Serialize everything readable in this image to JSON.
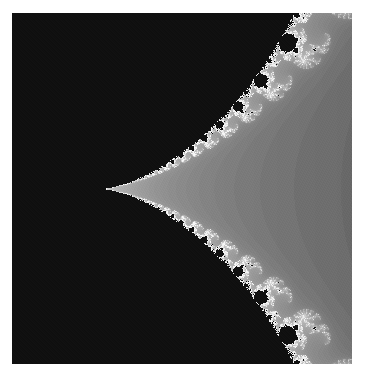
{
  "image": {
    "subject": "Mandelbrot set cusp (seahorse-valley style boundary detail)",
    "alt": "Grayscale fractal: black Mandelbrot set region on left with cusp pointing right, white and gray escape-time gradient on right",
    "colors": {
      "set": "#0d0d0d",
      "boundary": "#ffffff",
      "far_field": "#4a4a4a",
      "background": "#ffffff"
    },
    "view": {
      "center_re": 0.295,
      "center_im": 0.0,
      "width": 0.17,
      "cusp_re": 0.25
    }
  }
}
